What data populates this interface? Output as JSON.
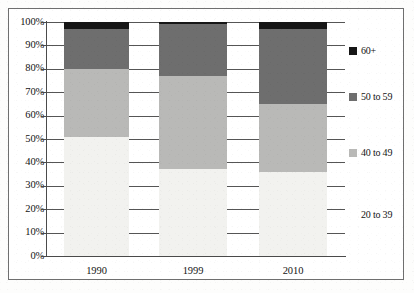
{
  "chart_data": {
    "type": "bar",
    "subtype": "stacked-percent-column",
    "title": "",
    "xlabel": "",
    "ylabel": "",
    "categories": [
      "1990",
      "1999",
      "2010"
    ],
    "ylim": [
      0,
      100
    ],
    "ytick_labels": [
      "0%",
      "10%",
      "20%",
      "30%",
      "40%",
      "50%",
      "60%",
      "70%",
      "80%",
      "90%",
      "100%"
    ],
    "ytick_values": [
      0,
      10,
      20,
      30,
      40,
      50,
      60,
      70,
      80,
      90,
      100
    ],
    "grid": true,
    "legend_position": "right",
    "series": [
      {
        "name": "20 to 39",
        "color": "#f2f2ef",
        "values": [
          51,
          37,
          36
        ]
      },
      {
        "name": "40 to 49",
        "color": "#b9b9b7",
        "values": [
          29,
          40,
          29
        ]
      },
      {
        "name": "50 to 59",
        "color": "#6e6e6e",
        "values": [
          17,
          22,
          32
        ]
      },
      {
        "name": "60+",
        "color": "#161616",
        "values": [
          3,
          1,
          3
        ]
      }
    ]
  },
  "legend": {
    "entries": [
      {
        "label": "60+",
        "color": "#161616",
        "show_swatch": true
      },
      {
        "label": "50 to 59",
        "color": "#6e6e6e",
        "show_swatch": true
      },
      {
        "label": "40 to 49",
        "color": "#b9b9b7",
        "show_swatch": true
      },
      {
        "label": "20 to 39",
        "color": "#f2f2ef",
        "show_swatch": false
      }
    ]
  },
  "colors": {
    "axis": "#4a4a4a",
    "grid": "#555555",
    "frame": "#6f6f6f",
    "background": "#ffffff",
    "text": "#141414"
  }
}
